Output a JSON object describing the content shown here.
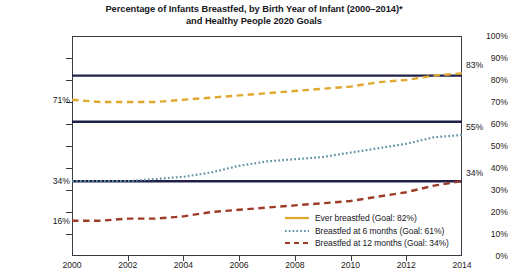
{
  "chart_data": {
    "type": "line",
    "title": "Percentage of Infants Breastfed, by Birth Year of Infant (2000–2014)* and Healthy People 2020 Goals",
    "title_line1": "Percentage of Infants Breastfed, by Birth Year of Infant (2000–2014)*",
    "title_line2": "and Healthy People 2020 Goals",
    "xlabel": "",
    "ylabel": "",
    "xlim": [
      2000,
      2014
    ],
    "ylim": [
      0,
      100
    ],
    "grid": false,
    "legend_position": "bottom-right",
    "x": [
      2000,
      2001,
      2002,
      2003,
      2004,
      2005,
      2006,
      2007,
      2008,
      2009,
      2010,
      2011,
      2012,
      2013,
      2014
    ],
    "y_ticks": [
      "0%",
      "10%",
      "20%",
      "30%",
      "40%",
      "50%",
      "60%",
      "70%",
      "80%",
      "90%",
      "100%"
    ],
    "y_tick_values": [
      0,
      10,
      20,
      30,
      40,
      50,
      60,
      70,
      80,
      90,
      100
    ],
    "x_ticks": [
      "2000",
      "2002",
      "2004",
      "2006",
      "2008",
      "2010",
      "2012",
      "2014"
    ],
    "x_tick_values": [
      2000,
      2002,
      2004,
      2006,
      2008,
      2010,
      2012,
      2014
    ],
    "series": [
      {
        "name": "Ever breastfed (Goal: 82%)",
        "short_name": "Ever breastfed",
        "goal": 82,
        "color": "#E0A82E",
        "style": "dashed",
        "values": [
          71,
          70,
          70,
          70,
          71,
          72,
          73,
          74,
          75,
          76,
          77,
          79,
          80,
          82,
          83
        ],
        "start_label": "71%",
        "end_label": "83%",
        "start_value": 71,
        "end_value": 83
      },
      {
        "name": "Breastfed at 6 months (Goal: 61%)",
        "short_name": "Breastfed at 6 months",
        "goal": 61,
        "color": "#5E8FA3",
        "style": "dotted",
        "values": [
          34,
          34,
          34,
          35,
          36,
          38,
          41,
          43,
          44,
          45,
          47,
          49,
          51,
          54,
          55
        ],
        "start_label": "34%",
        "end_label": "55%",
        "start_value": 34,
        "end_value": 55
      },
      {
        "name": "Breastfed at 12 months (Goal: 34%)",
        "short_name": "Breastfed at 12 months",
        "goal": 34,
        "color": "#9E3B28",
        "style": "dashed",
        "values": [
          16,
          16,
          17,
          17,
          18,
          20,
          21,
          22,
          23,
          24,
          25,
          27,
          29,
          32,
          34
        ],
        "start_label": "16%",
        "end_label": "34%",
        "start_value": 16,
        "end_value": 34
      }
    ],
    "goal_lines": [
      {
        "name": "Ever breastfed goal",
        "value": 82,
        "color": "#20204A"
      },
      {
        "name": "Breastfed at 6 months goal",
        "value": 61,
        "color": "#20204A"
      },
      {
        "name": "Breastfed at 12 months goal",
        "value": 34,
        "color": "#20204A"
      }
    ],
    "colors": {
      "ever_breastfed": "#E0A82E",
      "six_months": "#5E8FA3",
      "twelve_months": "#9E3B28",
      "goal_line": "#20204A",
      "axis": "#3A3A44",
      "text": "#16161B",
      "background": "#FFFFFF"
    }
  }
}
